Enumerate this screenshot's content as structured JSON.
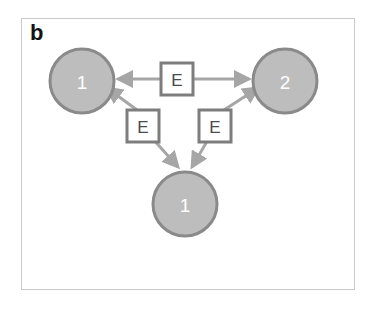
{
  "panel": {
    "label": "b",
    "background_color": "#ffffff",
    "frame_color": "#c9c9c9"
  },
  "colors": {
    "node_fill": "#bdbdbd",
    "node_stroke": "#8a8a8a",
    "node_text": "#ffffff",
    "box_fill": "#ffffff",
    "box_stroke": "#7d7d7d",
    "box_text": "#4a4a4a",
    "edge": "#a6a6a6",
    "panel_label": "#141414"
  },
  "diagram": {
    "type": "node-edge-graph",
    "nodes": [
      {
        "id": "node-left",
        "label": "1",
        "cx": 82,
        "cy": 81,
        "r": 32
      },
      {
        "id": "node-right",
        "label": "2",
        "cx": 285,
        "cy": 81,
        "r": 32
      },
      {
        "id": "node-bottom",
        "label": "1",
        "cx": 185,
        "cy": 204,
        "r": 32
      }
    ],
    "edge_boxes": [
      {
        "id": "box-top",
        "label": "E",
        "x": 161,
        "y": 63,
        "w": 32,
        "h": 32
      },
      {
        "id": "box-lower-left",
        "label": "E",
        "x": 127,
        "y": 110,
        "w": 32,
        "h": 32
      },
      {
        "id": "box-lower-right",
        "label": "E",
        "x": 199,
        "y": 110,
        "w": 32,
        "h": 32
      }
    ],
    "edges": [
      {
        "id": "edge-top-to-left",
        "from": "box-top",
        "to": "node-left",
        "arrow": "to"
      },
      {
        "id": "edge-top-to-right",
        "from": "box-top",
        "to": "node-right",
        "arrow": "to"
      },
      {
        "id": "edge-lower-left-to-left",
        "from": "box-lower-left",
        "to": "node-left",
        "arrow": "to"
      },
      {
        "id": "edge-lower-left-to-bottom",
        "from": "box-lower-left",
        "to": "node-bottom",
        "arrow": "to"
      },
      {
        "id": "edge-lower-right-to-right",
        "from": "box-lower-right",
        "to": "node-right",
        "arrow": "to"
      },
      {
        "id": "edge-lower-right-to-bottom",
        "from": "box-lower-right",
        "to": "node-bottom",
        "arrow": "to"
      }
    ]
  }
}
